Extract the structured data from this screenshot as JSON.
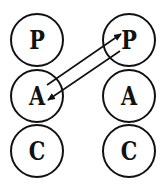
{
  "diagram": {
    "type": "transactional-analysis-pac",
    "colors": {
      "stroke": "#111111",
      "background": "#ffffff"
    },
    "left_person": {
      "states": [
        {
          "label": "P",
          "cx": 37,
          "cy": 40
        },
        {
          "label": "A",
          "cx": 37,
          "cy": 96
        },
        {
          "label": "C",
          "cx": 37,
          "cy": 151
        }
      ]
    },
    "right_person": {
      "states": [
        {
          "label": "P",
          "cx": 129,
          "cy": 40
        },
        {
          "label": "A",
          "cx": 129,
          "cy": 96
        },
        {
          "label": "C",
          "cx": 129,
          "cy": 151
        }
      ]
    },
    "radius": 26,
    "transactions": [
      {
        "from": "left.A",
        "to": "right.P",
        "x1": 47,
        "y1": 85,
        "x2": 121,
        "y2": 34
      },
      {
        "from": "right.P",
        "to": "left.A",
        "x1": 120,
        "y1": 51,
        "x2": 48,
        "y2": 100
      }
    ]
  }
}
